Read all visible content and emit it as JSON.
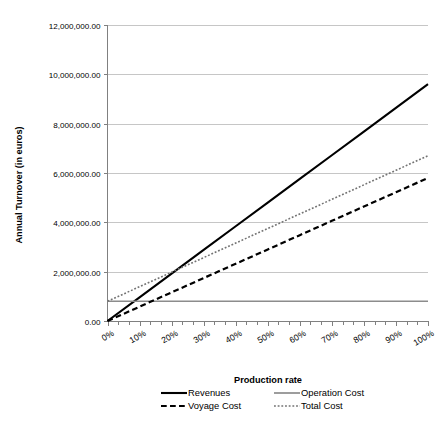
{
  "chart_data": {
    "type": "line",
    "title": "",
    "xlabel": "Production rate",
    "ylabel": "Annual Turnover (in euros)",
    "x": [
      0,
      10,
      20,
      30,
      40,
      50,
      60,
      70,
      80,
      90,
      100
    ],
    "xtick_labels": [
      "0%",
      "10%",
      "20%",
      "30%",
      "40%",
      "50%",
      "60%",
      "70%",
      "80%",
      "90%",
      "100%"
    ],
    "ytick_labels": [
      "0.00",
      "2,000,000.00",
      "4,000,000.00",
      "6,000,000.00",
      "8,000,000.00",
      "10,000,000.00",
      "12,000,000.00"
    ],
    "ytick_values": [
      0,
      2000000,
      4000000,
      6000000,
      8000000,
      10000000,
      12000000
    ],
    "ylim": [
      0,
      12000000
    ],
    "xlim": [
      0,
      100
    ],
    "grid": "horizontal",
    "legend_position": "bottom",
    "minor_xticks_per_interval": 2,
    "series": [
      {
        "name": "Revenues",
        "style": "solid",
        "color": "#000000",
        "width": 2.1,
        "values": [
          0,
          960000,
          1920000,
          2880000,
          3840000,
          4800000,
          5760000,
          6720000,
          7680000,
          8640000,
          9600000
        ]
      },
      {
        "name": "Operation Cost",
        "style": "solid",
        "color": "#8c8c8c",
        "width": 1.7,
        "values": [
          800000,
          800000,
          800000,
          800000,
          800000,
          800000,
          800000,
          800000,
          800000,
          800000,
          800000
        ]
      },
      {
        "name": "Voyage Cost",
        "style": "dashed",
        "color": "#000000",
        "width": 2.2,
        "values": [
          0,
          580000,
          1160000,
          1740000,
          2320000,
          2900000,
          3480000,
          4060000,
          4640000,
          5220000,
          5800000
        ]
      },
      {
        "name": "Total Cost",
        "style": "dotted",
        "color": "#737373",
        "width": 1.6,
        "values": [
          800000,
          1390000,
          1980000,
          2570000,
          3160000,
          3750000,
          4340000,
          4930000,
          5520000,
          6110000,
          6700000
        ]
      }
    ]
  },
  "legend": {
    "entries": [
      {
        "label": "Revenues"
      },
      {
        "label": "Operation Cost"
      },
      {
        "label": "Voyage Cost"
      },
      {
        "label": "Total Cost"
      }
    ]
  }
}
